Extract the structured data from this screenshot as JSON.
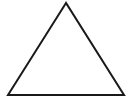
{
  "shape": {
    "type": "triangle",
    "stroke": "#1a1a1a",
    "fill": "#ffffff",
    "points": "66,3 8,95 124,95"
  }
}
